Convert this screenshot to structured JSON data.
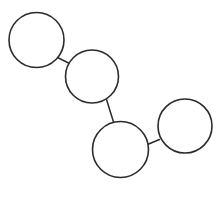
{
  "canvas": {
    "width": 222,
    "height": 198,
    "background_color": "#ffffff",
    "title": "Chain of four connected circles"
  },
  "style": {
    "stroke_color": "#2e2a2b",
    "fill_color": "#ffffff",
    "stroke_width": 1.6,
    "connector_stroke_width": 1.5
  },
  "diagram": {
    "type": "node-link-chain",
    "node_count": 4,
    "link_count": 3,
    "nodes": [
      {
        "id": "circle-1",
        "label": "",
        "cx": 36.5,
        "cy": 40.0,
        "r": 27.5
      },
      {
        "id": "circle-2",
        "label": "",
        "cx": 92.0,
        "cy": 76.5,
        "r": 26.5
      },
      {
        "id": "circle-3",
        "label": "",
        "cx": 120.5,
        "cy": 149.5,
        "r": 28.0
      },
      {
        "id": "circle-4",
        "label": "",
        "cx": 185.0,
        "cy": 126.0,
        "r": 27.0
      }
    ],
    "links": [
      {
        "id": "link-1-2",
        "from": "circle-1",
        "to": "circle-2",
        "x1": 57.5,
        "y1": 57.5,
        "x2": 68.5,
        "y2": 63.0
      },
      {
        "id": "link-2-3",
        "from": "circle-2",
        "to": "circle-3",
        "x1": 106.5,
        "y1": 99.5,
        "x2": 113.5,
        "y2": 122.0
      },
      {
        "id": "link-3-4",
        "from": "circle-3",
        "to": "circle-4",
        "x1": 147.5,
        "y1": 144.5,
        "x2": 159.5,
        "y2": 139.5
      }
    ]
  }
}
